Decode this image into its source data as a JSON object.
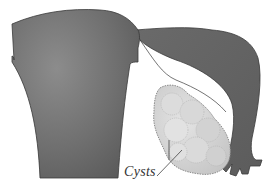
{
  "figure": {
    "labels": [
      {
        "text": "Cysts"
      }
    ]
  },
  "colors": {
    "uterus": "#6e6e6e",
    "uterus_highlight": "#8a8a8a",
    "tube": "#666666",
    "ovary": "#d4d4d4",
    "cyst_outline": "#9a9a9a",
    "outline": "#3a3a3a",
    "background": "#ffffff"
  }
}
